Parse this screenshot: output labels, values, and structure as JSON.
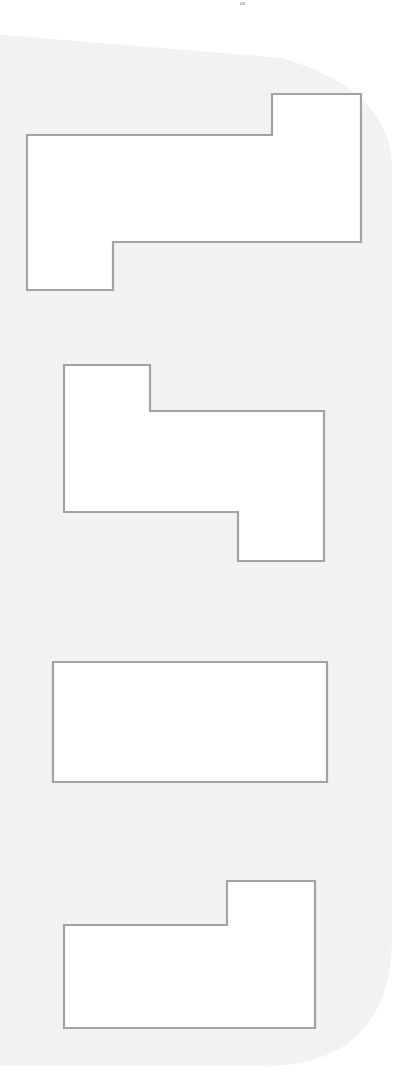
{
  "canvas": {
    "width": 411,
    "height": 1082,
    "page_background": "#ffffff",
    "title": "Outlined Rectilinear Shapes"
  },
  "panel": {
    "name": "rounded-gray-panel",
    "fill": "#f2f2f2",
    "corner_radius_top_right": 110,
    "corner_radius_bottom_right": 130,
    "top_edge_y_left": 34,
    "top_edge_y_right": 58,
    "bottom_edge_y": 1066,
    "left_edge_x": -10,
    "right_edge_x": 392
  },
  "style": {
    "shape_fill": "#ffffff",
    "stroke_color": "#a3a3a3",
    "stroke_width": 2.2
  },
  "shapes": [
    {
      "id": "shape-1",
      "name": "z-step-polygon-top",
      "label": "Shape 1",
      "vertex_count": 8,
      "points": "27,135 272,135 272,94 361,94 361,242 113,242 113,290 27,290",
      "bbox": {
        "x": 27,
        "y": 94,
        "width": 334,
        "height": 196
      }
    },
    {
      "id": "shape-2",
      "name": "z-step-polygon-second",
      "label": "Shape 2",
      "vertex_count": 8,
      "points": "64,365 150,365 150,411 324,411 324,561 238,561 238,512 64,512",
      "bbox": {
        "x": 64,
        "y": 365,
        "width": 260,
        "height": 196
      }
    },
    {
      "id": "shape-3",
      "name": "plain-rectangle",
      "label": "Shape 3",
      "vertex_count": 4,
      "points": "53,662 327,662 327,782 53,782",
      "bbox": {
        "x": 53,
        "y": 662,
        "width": 274,
        "height": 120
      }
    },
    {
      "id": "shape-4",
      "name": "notched-rectangle-bottom",
      "label": "Shape 4",
      "vertex_count": 6,
      "points": "64,925 227,925 227,881 315,881 315,1028 64,1028",
      "bbox": {
        "x": 64,
        "y": 881,
        "width": 251,
        "height": 147
      }
    }
  ],
  "speck": {
    "name": "top-edge-speck",
    "x": 240,
    "y": 2,
    "width": 5,
    "height": 3,
    "fill": "#c9c9c9"
  }
}
